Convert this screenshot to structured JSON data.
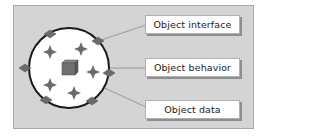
{
  "diagram": {
    "type": "object-structure",
    "labels": {
      "interface": "Object interface",
      "behavior": "Object behavior",
      "data": "Object data"
    },
    "elements": {
      "circle": "object-boundary",
      "boundary_diamonds": 7,
      "inner_stars": 5,
      "center_cube": "data-cube"
    },
    "colors": {
      "frame_background": "#d4d4d4",
      "frame_border": "#a8a8a8",
      "circle_fill": "#ffffff",
      "circle_stroke": "#1a1a1a",
      "shape_fill": "#6a6a6a",
      "connector": "#8a8a8a",
      "label_background": "#ffffff",
      "label_text": "#222222"
    }
  }
}
